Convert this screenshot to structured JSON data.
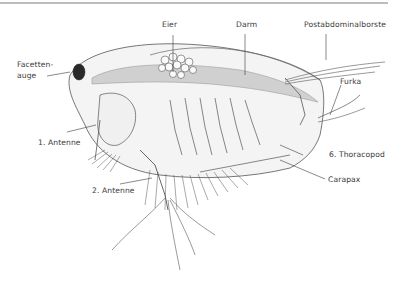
{
  "figure": {
    "labels": {
      "eier": "Eier",
      "darm": "Darm",
      "postabdominalborste": "Postabdominalborste",
      "facettenauge_line1": "Facetten-",
      "facettenauge_line2": "auge",
      "furka": "Furka",
      "antenne1": "1. Antenne",
      "thoracopod6": "6. Thoracopod",
      "carapax": "Carapax",
      "antenne2": "2. Antenne"
    }
  },
  "colors": {
    "line": "#3a3a3a",
    "body_fill": "#f2f2f2",
    "gut_fill": "#bdbdbd",
    "eye_fill": "#2a2a2a",
    "border": "#bdbdbd"
  }
}
